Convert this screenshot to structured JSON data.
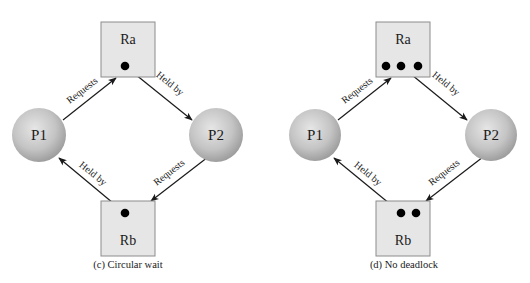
{
  "colors": {
    "background": "#ffffff",
    "resource_fill": "#e6e6e6",
    "resource_stroke": "#8c8c8c",
    "process_light": "#e4e4e4",
    "process_dark": "#9a9a9a",
    "line": "#1a1a1a",
    "dot": "#000000"
  },
  "panels": [
    {
      "id": "circular-wait",
      "caption": "(c) Circular wait",
      "caption_pos": [
        128,
        268
      ],
      "processes": [
        {
          "id": "P1",
          "label": "P1",
          "cx": 39,
          "cy": 135,
          "r": 27
        },
        {
          "id": "P2",
          "label": "P2",
          "cx": 216,
          "cy": 135,
          "r": 27
        }
      ],
      "resources": [
        {
          "id": "Ra",
          "label": "Ra",
          "x": 101,
          "y": 22,
          "w": 54,
          "h": 55,
          "label_y": 44,
          "dots": [
            [
              125,
              66
            ]
          ]
        },
        {
          "id": "Rb",
          "label": "Rb",
          "x": 101,
          "y": 201,
          "w": 54,
          "h": 55,
          "label_y": 245,
          "dots": [
            [
              125,
              213
            ]
          ]
        }
      ],
      "edges": [
        {
          "label": "Requests",
          "from": "P1",
          "to": "Ra",
          "x1": 63,
          "y1": 120,
          "x2": 116,
          "y2": 78,
          "arrow": true,
          "label_x": 84,
          "label_y": 93,
          "angle": -38
        },
        {
          "label": "Held by",
          "from": "Ra",
          "to": "P2",
          "x1": 125,
          "y1": 66,
          "x2": 192,
          "y2": 120,
          "arrow": true,
          "label_x": 168,
          "label_y": 86,
          "angle": 39
        },
        {
          "label": "Requests",
          "from": "P2",
          "to": "Rb",
          "x1": 208,
          "y1": 157,
          "x2": 151,
          "y2": 201,
          "arrow": true,
          "label_x": 171,
          "label_y": 175,
          "angle": -38
        },
        {
          "label": "Held by",
          "from": "Rb",
          "to": "P1",
          "x1": 125,
          "y1": 213,
          "x2": 59,
          "y2": 158,
          "arrow": true,
          "label_x": 91,
          "label_y": 176,
          "angle": 39
        }
      ]
    },
    {
      "id": "no-deadlock",
      "caption": "(d) No deadlock",
      "caption_pos": [
        404,
        268
      ],
      "processes": [
        {
          "id": "P1",
          "label": "P1",
          "cx": 315,
          "cy": 135,
          "r": 26
        },
        {
          "id": "P2",
          "label": "P2",
          "cx": 491,
          "cy": 135,
          "r": 26
        }
      ],
      "resources": [
        {
          "id": "Ra",
          "label": "Ra",
          "x": 376,
          "y": 22,
          "w": 54,
          "h": 55,
          "label_y": 44,
          "dots": [
            [
              386,
              66
            ],
            [
              401,
              66
            ],
            [
              418,
              66
            ]
          ]
        },
        {
          "id": "Rb",
          "label": "Rb",
          "x": 376,
          "y": 201,
          "w": 54,
          "h": 55,
          "label_y": 245,
          "dots": [
            [
              401,
              213
            ],
            [
              416,
              213
            ]
          ]
        }
      ],
      "edges": [
        {
          "label": "Requests",
          "from": "P1",
          "to": "Ra",
          "x1": 338,
          "y1": 120,
          "x2": 391,
          "y2": 78,
          "arrow": true,
          "label_x": 359,
          "label_y": 93,
          "angle": -38
        },
        {
          "label": "Held by",
          "from": "Ra",
          "to": "P2",
          "x1": 401,
          "y1": 66,
          "x2": 467,
          "y2": 120,
          "arrow": true,
          "label_x": 444,
          "label_y": 86,
          "angle": 39
        },
        {
          "label": "Requests",
          "from": "P2",
          "to": "Rb",
          "x1": 483,
          "y1": 157,
          "x2": 426,
          "y2": 201,
          "arrow": true,
          "label_x": 446,
          "label_y": 175,
          "angle": -38
        },
        {
          "label": "Held by",
          "from": "Rb",
          "to": "P1",
          "x1": 401,
          "y1": 213,
          "x2": 334,
          "y2": 158,
          "arrow": true,
          "label_x": 366,
          "label_y": 176,
          "angle": 39
        }
      ]
    }
  ]
}
